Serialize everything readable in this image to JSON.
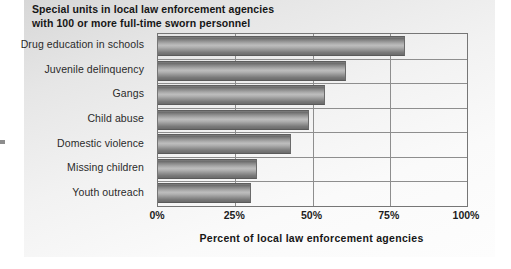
{
  "chart_data": {
    "type": "bar",
    "orientation": "horizontal",
    "title": "Special units in local law enforcement agencies with 100 or more full-time sworn personnel",
    "title_lines": [
      "Special units in local law enforcement agencies",
      "with 100 or more full-time sworn personnel"
    ],
    "categories": [
      "Drug education in schools",
      "Juvenile delinquency",
      "Gangs",
      "Child abuse",
      "Domestic violence",
      "Missing children",
      "Youth outreach"
    ],
    "values": [
      80,
      61,
      54,
      49,
      43,
      32,
      30
    ],
    "xlabel": "Percent of local law enforcement agencies",
    "ylabel": "",
    "xlim": [
      0,
      100
    ],
    "xticks": [
      0,
      25,
      50,
      75,
      100
    ],
    "xtick_labels": [
      "0%",
      "25%",
      "50%",
      "75%",
      "100%"
    ],
    "grid": true,
    "grid_axis": "both",
    "legend": false,
    "series": [
      {
        "name": "Percent of local law enforcement agencies",
        "values": [
          80,
          61,
          54,
          49,
          43,
          32,
          30
        ]
      }
    ]
  },
  "colors": {
    "panel_background": "#f2f2f2",
    "bar_dark": "#6b6b6b",
    "bar_light": "#bdbdbd",
    "axis_line": "#767676",
    "grid_line": "#8e8e8e",
    "text": "#161616"
  }
}
